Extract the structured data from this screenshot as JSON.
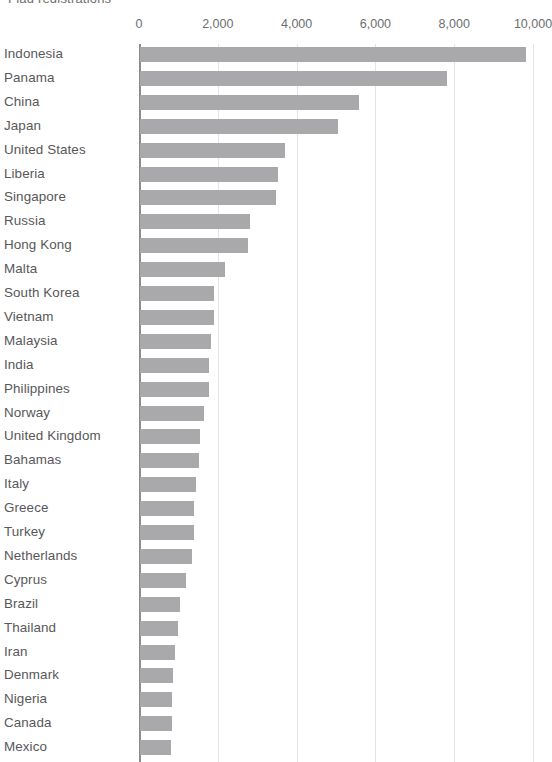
{
  "chart": {
    "title_clipped": "Flag registrations",
    "axis_label_color": "#6d6e71",
    "bar_color": "#a9a9ab",
    "gridline_color": "#e3e3e3",
    "axis_color": "#8c8c8e"
  },
  "chart_data": {
    "type": "bar",
    "orientation": "horizontal",
    "title": "Flag registrations",
    "xlabel": "",
    "ylabel": "",
    "xlim": [
      0,
      10000
    ],
    "xticks": [
      0,
      2000,
      4000,
      6000,
      8000,
      10000
    ],
    "xtick_labels": [
      "0",
      "2,000",
      "4,000",
      "6,000",
      "8,000",
      "10,000"
    ],
    "grid": true,
    "legend": null,
    "categories": [
      "Indonesia",
      "Panama",
      "China",
      "Japan",
      "United States",
      "Liberia",
      "Singapore",
      "Russia",
      "Hong Kong",
      "Malta",
      "South Korea",
      "Vietnam",
      "Malaysia",
      "India",
      "Philippines",
      "Norway",
      "United Kingdom",
      "Bahamas",
      "Italy",
      "Greece",
      "Turkey",
      "Netherlands",
      "Cyprus",
      "Brazil",
      "Thailand",
      "Iran",
      "Denmark",
      "Nigeria",
      "Canada",
      "Mexico"
    ],
    "values": [
      9800,
      7800,
      5550,
      5020,
      3670,
      3490,
      3460,
      2780,
      2730,
      2170,
      1890,
      1880,
      1800,
      1760,
      1760,
      1630,
      1520,
      1510,
      1420,
      1380,
      1370,
      1320,
      1160,
      1010,
      960,
      900,
      830,
      810,
      800,
      780
    ]
  }
}
